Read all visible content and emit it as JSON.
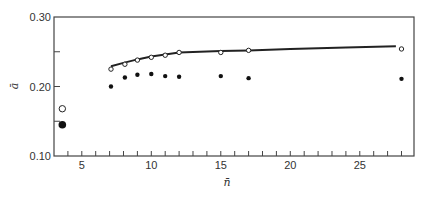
{
  "chart_data": {
    "type": "scatter",
    "title": "",
    "xlabel": "n̄",
    "ylabel": "ā",
    "xlim": [
      3.0,
      28.9
    ],
    "ylim": [
      0.1,
      0.3
    ],
    "grid": false,
    "legend": null,
    "x_ticks_major": [
      5,
      10,
      15,
      20,
      25
    ],
    "x_tick_labels": [
      "5",
      "10",
      "15",
      "20",
      "25"
    ],
    "x_ticks_minor": [
      4,
      6,
      7,
      8,
      9,
      11,
      12,
      13,
      14,
      16,
      17,
      18,
      19,
      21,
      22,
      23,
      24,
      26,
      27,
      28
    ],
    "y_ticks_major": [
      0.1,
      0.2,
      0.3
    ],
    "y_tick_labels": [
      "0.10",
      "0.20",
      "0.30"
    ],
    "y_ticks_minor": [
      0.15,
      0.25
    ],
    "series": [
      {
        "name": "open-circles",
        "marker": "open-circle",
        "x": [
          3.6,
          7.1,
          8.1,
          9.0,
          10.0,
          11.0,
          12.0,
          15.0,
          17.0,
          28.0
        ],
        "y": [
          0.168,
          0.225,
          0.232,
          0.238,
          0.242,
          0.245,
          0.249,
          0.249,
          0.252,
          0.254
        ]
      },
      {
        "name": "filled-circles",
        "marker": "filled-circle",
        "x": [
          3.6,
          7.1,
          8.1,
          9.0,
          10.0,
          11.0,
          12.0,
          15.0,
          17.0,
          28.0
        ],
        "y": [
          0.145,
          0.2,
          0.213,
          0.217,
          0.218,
          0.215,
          0.214,
          0.215,
          0.212,
          0.211
        ]
      },
      {
        "name": "fit-curve",
        "marker": "line",
        "x": [
          7.1,
          8.0,
          9.0,
          10.0,
          11.0,
          12.0,
          15.0,
          17.0,
          20.0,
          24.0,
          27.6
        ],
        "y": [
          0.229,
          0.234,
          0.239,
          0.243,
          0.246,
          0.249,
          0.251,
          0.252,
          0.254,
          0.256,
          0.258
        ]
      }
    ]
  }
}
